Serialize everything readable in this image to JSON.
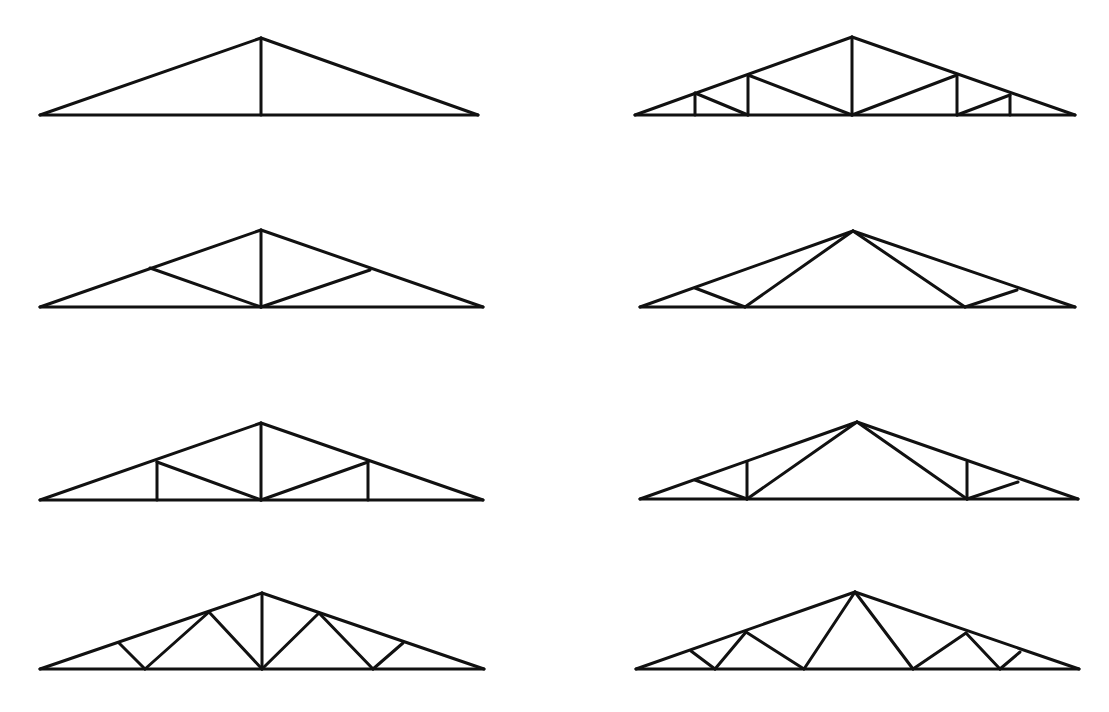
{
  "diagram": {
    "title": "",
    "stroke_color": "#111111",
    "background": "#ffffff",
    "trusses": [
      {
        "id": "truss-king-post",
        "name": "King post truss",
        "lines": [
          [
            40,
            115,
            478,
            115
          ],
          [
            40,
            115,
            261,
            38
          ],
          [
            261,
            38,
            478,
            115
          ],
          [
            261,
            38,
            261,
            115
          ]
        ]
      },
      {
        "id": "truss-multi-panel-vertical",
        "name": "Multi-panel truss with verticals",
        "lines": [
          [
            635,
            115,
            1075,
            115
          ],
          [
            635,
            115,
            852,
            37
          ],
          [
            852,
            37,
            1075,
            115
          ],
          [
            852,
            37,
            852,
            115
          ],
          [
            695,
            93,
            695,
            115
          ],
          [
            748,
            75,
            748,
            115
          ],
          [
            695,
            93,
            748,
            115
          ],
          [
            748,
            75,
            852,
            115
          ],
          [
            957,
            75,
            957,
            115
          ],
          [
            1010,
            95,
            1010,
            115
          ],
          [
            852,
            115,
            957,
            75
          ],
          [
            957,
            115,
            1010,
            95
          ]
        ]
      },
      {
        "id": "truss-fink-king",
        "name": "King post with struts (W-style)",
        "lines": [
          [
            40,
            307,
            483,
            307
          ],
          [
            40,
            307,
            261,
            230
          ],
          [
            261,
            230,
            483,
            307
          ],
          [
            261,
            230,
            261,
            307
          ],
          [
            150,
            268,
            261,
            307
          ],
          [
            261,
            307,
            370,
            270
          ]
        ]
      },
      {
        "id": "truss-fink",
        "name": "Fink truss",
        "lines": [
          [
            640,
            307,
            1075,
            307
          ],
          [
            640,
            307,
            853,
            231
          ],
          [
            853,
            231,
            1075,
            307
          ],
          [
            695,
            288,
            745,
            307
          ],
          [
            745,
            307,
            853,
            231
          ],
          [
            853,
            231,
            965,
            307
          ],
          [
            965,
            307,
            1017,
            290
          ]
        ]
      },
      {
        "id": "truss-queen-post",
        "name": "Queen post with king post",
        "lines": [
          [
            40,
            500,
            483,
            500
          ],
          [
            40,
            500,
            261,
            423
          ],
          [
            261,
            423,
            483,
            500
          ],
          [
            261,
            423,
            261,
            500
          ],
          [
            157,
            462,
            157,
            500
          ],
          [
            368,
            462,
            368,
            500
          ],
          [
            157,
            462,
            261,
            500
          ],
          [
            261,
            500,
            368,
            462
          ]
        ]
      },
      {
        "id": "truss-fink-vertical",
        "name": "Fink truss with verticals",
        "lines": [
          [
            640,
            499,
            1078,
            499
          ],
          [
            640,
            499,
            857,
            422
          ],
          [
            857,
            422,
            1078,
            499
          ],
          [
            747,
            462,
            747,
            499
          ],
          [
            967,
            462,
            967,
            499
          ],
          [
            695,
            480,
            747,
            499
          ],
          [
            747,
            499,
            857,
            422
          ],
          [
            857,
            422,
            967,
            499
          ],
          [
            967,
            499,
            1018,
            482
          ]
        ]
      },
      {
        "id": "truss-howe-warren",
        "name": "Multi-web truss with king post",
        "lines": [
          [
            40,
            669,
            484,
            669
          ],
          [
            40,
            669,
            262,
            593
          ],
          [
            262,
            593,
            484,
            669
          ],
          [
            262,
            593,
            262,
            669
          ],
          [
            119,
            643,
            145,
            669
          ],
          [
            145,
            669,
            209,
            612
          ],
          [
            209,
            612,
            262,
            669
          ],
          [
            262,
            669,
            319,
            613
          ],
          [
            319,
            613,
            373,
            669
          ],
          [
            373,
            669,
            403,
            643
          ]
        ]
      },
      {
        "id": "truss-double-fink",
        "name": "Double Fink truss",
        "lines": [
          [
            636,
            669,
            1079,
            669
          ],
          [
            636,
            669,
            855,
            592
          ],
          [
            855,
            592,
            1079,
            669
          ],
          [
            691,
            651,
            715,
            669
          ],
          [
            715,
            669,
            746,
            632
          ],
          [
            746,
            632,
            804,
            669
          ],
          [
            804,
            669,
            855,
            592
          ],
          [
            855,
            592,
            913,
            669
          ],
          [
            913,
            669,
            966,
            633
          ],
          [
            966,
            633,
            1000,
            669
          ],
          [
            1000,
            669,
            1020,
            652
          ]
        ]
      }
    ]
  }
}
